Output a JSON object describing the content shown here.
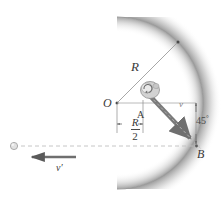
{
  "figure": {
    "background_color": "#ffffff",
    "width": 223,
    "height": 211,
    "labels": {
      "radius_diagonal": "R",
      "center_point": "O",
      "midpoint_A": "A",
      "landing_point_B": "B",
      "velocity_in": "v",
      "velocity_out": "v′",
      "distance_numerator": "R",
      "distance_denominator": "2",
      "angle_value": "45",
      "angle_degree_symbol": "°"
    },
    "icons": {
      "ball_in_bowl": "ball-icon",
      "ball_outgoing": "small-ball-icon",
      "velocity_arrow_in": "thick-arrow-down-right-icon",
      "velocity_arrow_out": "thick-arrow-left-icon",
      "dimension_arrows": "dimension-arrow-icon",
      "angle_marker": "angle-extent-icon"
    },
    "colors": {
      "bowl_fill": "#ffffff",
      "bowl_shadow": "#bfbfbf",
      "outside_fill": "#d8d8d8",
      "line_gray": "#8d8d8d",
      "arrow_gray": "#6f6f6f",
      "dash_gray": "#b5b5b5",
      "text_gray": "#3a3a3a"
    },
    "geometry": {
      "center_O": [
        117,
        103
      ],
      "point_A": [
        143,
        103
      ],
      "point_B": [
        197,
        146
      ],
      "radius_px": 86,
      "launch_angle_deg": 45
    }
  }
}
